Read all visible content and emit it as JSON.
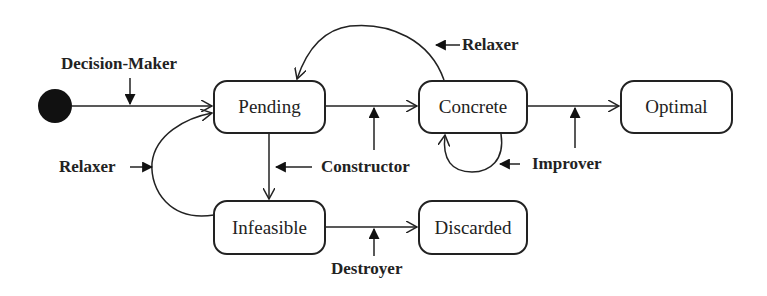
{
  "diagram": {
    "type": "state-machine",
    "initial_state": "Pending",
    "states": [
      {
        "id": "pending",
        "label": "Pending"
      },
      {
        "id": "concrete",
        "label": "Concrete"
      },
      {
        "id": "optimal",
        "label": "Optimal"
      },
      {
        "id": "infeasible",
        "label": "Infeasible"
      },
      {
        "id": "discarded",
        "label": "Discarded"
      }
    ],
    "actors": {
      "decision_maker": "Decision-Maker",
      "relaxer_top": "Relaxer",
      "relaxer_left": "Relaxer",
      "constructor": "Constructor",
      "improver": "Improver",
      "destroyer": "Destroyer"
    },
    "transitions": [
      {
        "from": "start",
        "to": "Pending",
        "actor": "Decision-Maker"
      },
      {
        "from": "Pending",
        "to": "Concrete",
        "actor": "Constructor"
      },
      {
        "from": "Pending",
        "to": "Infeasible",
        "actor": "Constructor"
      },
      {
        "from": "Concrete",
        "to": "Pending",
        "actor": "Relaxer"
      },
      {
        "from": "Concrete",
        "to": "Concrete",
        "actor": "Improver"
      },
      {
        "from": "Concrete",
        "to": "Optimal",
        "actor": "Improver"
      },
      {
        "from": "Infeasible",
        "to": "Pending",
        "actor": "Relaxer"
      },
      {
        "from": "Infeasible",
        "to": "Discarded",
        "actor": "Destroyer"
      }
    ]
  }
}
